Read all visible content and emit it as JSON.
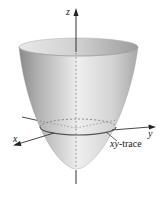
{
  "figure": {
    "type": "3d-surface-diagram",
    "surface": "elliptic paraboloid (opening upward)",
    "axes": {
      "z_label": "z",
      "x_label": "x",
      "y_label": "y"
    },
    "annotation": {
      "trace_label_italic": "xy",
      "trace_label_rest": "-trace"
    },
    "colors": {
      "surface_light": "#f2f2f2",
      "surface_mid": "#c8c8c8",
      "surface_dark": "#8f8f8f",
      "axis": "#333333",
      "trace": "#555555"
    }
  }
}
